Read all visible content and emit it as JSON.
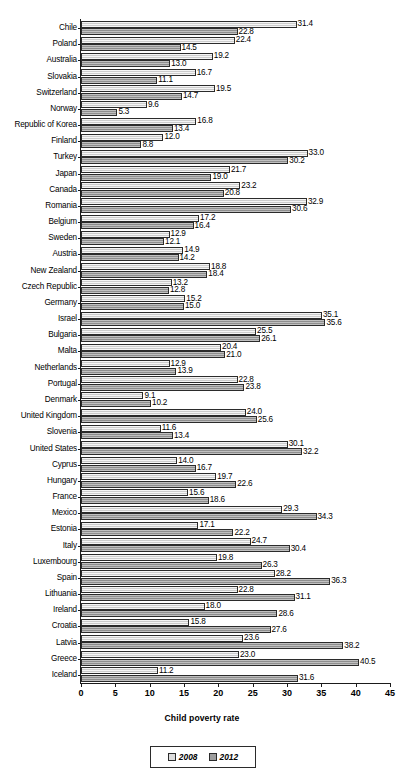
{
  "chart_data": {
    "type": "bar",
    "orientation": "horizontal",
    "title": "",
    "xlabel": "Child poverty rate",
    "ylabel": "",
    "xlim": [
      0,
      45
    ],
    "xticks": [
      0,
      5,
      10,
      15,
      20,
      25,
      30,
      35,
      40,
      45
    ],
    "grid": false,
    "legend_position": "bottom-center",
    "categories": [
      "Chile",
      "Poland",
      "Australia",
      "Slovakia",
      "Switzerland",
      "Norway",
      "Republic of Korea",
      "Finland",
      "Turkey",
      "Japan",
      "Canada",
      "Romania",
      "Belgium",
      "Sweden",
      "Austria",
      "New Zealand",
      "Czech Republic",
      "Germany",
      "Israel",
      "Bulgaria",
      "Malta",
      "Netherlands",
      "Portugal",
      "Denmark",
      "United Kingdom",
      "Slovenia",
      "United States",
      "Cyprus",
      "Hungary",
      "France",
      "Mexico",
      "Estonia",
      "Italy",
      "Luxembourg",
      "Spain",
      "Lithuania",
      "Ireland",
      "Croatia",
      "Latvia",
      "Greece",
      "Iceland"
    ],
    "series": [
      {
        "name": "2008",
        "color": "#d7d7d7",
        "values": [
          31.4,
          22.4,
          19.2,
          16.7,
          19.5,
          9.6,
          16.8,
          12.0,
          33.0,
          21.7,
          23.2,
          32.9,
          17.2,
          12.9,
          14.9,
          18.8,
          13.2,
          15.2,
          35.1,
          25.5,
          20.4,
          12.9,
          22.8,
          9.1,
          24.0,
          11.6,
          30.1,
          14.0,
          19.7,
          15.6,
          29.3,
          17.1,
          24.7,
          19.8,
          28.2,
          22.8,
          18.0,
          15.8,
          23.6,
          23.0,
          11.2
        ]
      },
      {
        "name": "2012",
        "color": "#9e9e9e",
        "values": [
          22.8,
          14.5,
          13.0,
          11.1,
          14.7,
          5.3,
          13.4,
          8.8,
          30.2,
          19.0,
          20.8,
          30.6,
          16.4,
          12.1,
          14.2,
          18.4,
          12.8,
          15.0,
          35.6,
          26.1,
          21.0,
          13.9,
          23.8,
          10.2,
          25.6,
          13.4,
          32.2,
          16.7,
          22.6,
          18.6,
          34.3,
          22.2,
          30.4,
          26.3,
          36.3,
          31.1,
          28.6,
          27.6,
          38.2,
          40.5,
          31.6
        ]
      }
    ]
  },
  "legend": {
    "entries": [
      {
        "label": "2008",
        "swatch": "legend-swatch-2008"
      },
      {
        "label": "2012",
        "swatch": "legend-swatch-2012"
      }
    ]
  },
  "axis": {
    "x_title": "Child poverty rate"
  }
}
